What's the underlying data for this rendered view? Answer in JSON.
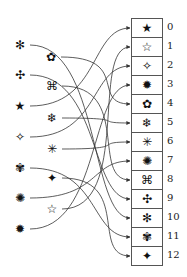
{
  "diagram": {
    "type": "mapping",
    "slots": [
      {
        "index": "0",
        "symbol": "★",
        "icon": "filled-star-icon"
      },
      {
        "index": "1",
        "symbol": "☆",
        "icon": "outline-star-icon"
      },
      {
        "index": "2",
        "symbol": "✧",
        "icon": "outline-four-point-star-icon"
      },
      {
        "index": "3",
        "symbol": "✹",
        "icon": "filled-burst-icon"
      },
      {
        "index": "4",
        "symbol": "✿",
        "icon": "flower-icon"
      },
      {
        "index": "5",
        "symbol": "❄",
        "icon": "snowflake-icon"
      },
      {
        "index": "6",
        "symbol": "✳",
        "icon": "sparkle-icon"
      },
      {
        "index": "7",
        "symbol": "✺",
        "icon": "sunburst-icon"
      },
      {
        "index": "8",
        "symbol": "⌘",
        "icon": "clover-outline-icon"
      },
      {
        "index": "9",
        "symbol": "✣",
        "icon": "dotted-cross-icon"
      },
      {
        "index": "10",
        "symbol": "✻",
        "icon": "asterisk-flake-icon"
      },
      {
        "index": "11",
        "symbol": "✾",
        "icon": "winged-flower-icon"
      },
      {
        "index": "12",
        "symbol": "✦",
        "icon": "filled-four-point-star-icon"
      }
    ],
    "sources": [
      {
        "symbol": "✻",
        "icon": "asterisk-flake-icon",
        "x": 20,
        "y": 45,
        "target": 10
      },
      {
        "symbol": "✿",
        "icon": "flower-icon",
        "x": 51,
        "y": 57,
        "target": 4
      },
      {
        "symbol": "✣",
        "icon": "dotted-cross-icon",
        "x": 20,
        "y": 75,
        "target": 9
      },
      {
        "symbol": "⌘",
        "icon": "clover-outline-icon",
        "x": 52,
        "y": 86,
        "target": 8
      },
      {
        "symbol": "★",
        "icon": "filled-star-icon",
        "x": 20,
        "y": 106,
        "target": 0
      },
      {
        "symbol": "❄",
        "icon": "snowflake-icon",
        "x": 52,
        "y": 118,
        "target": 5
      },
      {
        "symbol": "✧",
        "icon": "outline-four-point-star-icon",
        "x": 20,
        "y": 137,
        "target": 2
      },
      {
        "symbol": "✳",
        "icon": "sparkle-icon",
        "x": 52,
        "y": 149,
        "target": 6
      },
      {
        "symbol": "✾",
        "icon": "winged-flower-icon",
        "x": 20,
        "y": 168,
        "target": 11
      },
      {
        "symbol": "✦",
        "icon": "filled-four-point-star-icon",
        "x": 52,
        "y": 178,
        "target": 12
      },
      {
        "symbol": "✺",
        "icon": "sunburst-icon",
        "x": 20,
        "y": 198,
        "target": 7
      },
      {
        "symbol": "☆",
        "icon": "outline-star-icon",
        "x": 52,
        "y": 209,
        "target": 1
      },
      {
        "symbol": "✹",
        "icon": "filled-burst-icon",
        "x": 20,
        "y": 229,
        "target": 3
      }
    ],
    "colors": {
      "line": "#333333",
      "border": "#555555",
      "text": "#111111",
      "background": "#ffffff"
    }
  }
}
